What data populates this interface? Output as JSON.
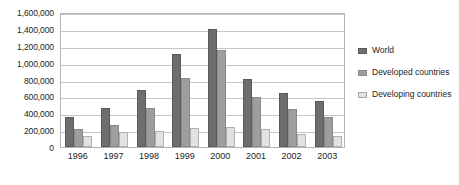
{
  "chart_data": {
    "type": "bar",
    "title": "",
    "xlabel": "",
    "ylabel": "",
    "categories": [
      "1996",
      "1997",
      "1998",
      "1999",
      "2000",
      "2001",
      "2002",
      "2003"
    ],
    "series": [
      {
        "name": "World",
        "color": "#6e6e6e",
        "values": [
          350000,
          460000,
          680000,
          1100000,
          1400000,
          810000,
          640000,
          550000
        ]
      },
      {
        "name": "Developed countries",
        "color": "#9e9e9e",
        "values": [
          215000,
          260000,
          460000,
          820000,
          1150000,
          590000,
          450000,
          360000
        ]
      },
      {
        "name": "Developing countries",
        "color": "#e2e2e2",
        "values": [
          125000,
          180000,
          190000,
          230000,
          240000,
          210000,
          160000,
          130000
        ]
      }
    ],
    "ylim": [
      0,
      1600000
    ],
    "ytick_values": [
      0,
      200000,
      400000,
      600000,
      800000,
      1000000,
      1200000,
      1400000,
      1600000
    ],
    "ytick_labels": [
      "0",
      "200,000",
      "400,000",
      "600,000",
      "800,000",
      "1,000,000",
      "1,200,000",
      "1,400,000",
      "1,600,000"
    ],
    "grid": "horizontal",
    "legend_position": "right",
    "legend_entries": [
      "World",
      "Developed countries",
      "Developing countries"
    ]
  }
}
